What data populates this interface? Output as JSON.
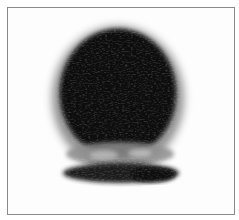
{
  "image": {
    "description": "Grayscale scanned dark blob (ink-blot / fingerprint-like shape) inside a thin rectangular frame",
    "colors": {
      "background": "#fdfdfd",
      "frame_border": "#8a8a8a",
      "blob_core": "#050505",
      "blob_mid": "#2a2a2a",
      "blob_light_band": "#9a9a9a",
      "blob_base": "#1a1a1a"
    }
  }
}
